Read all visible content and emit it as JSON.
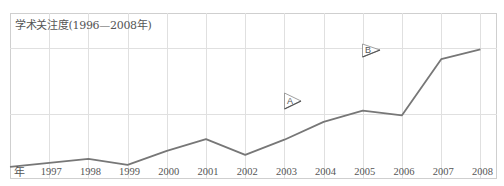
{
  "chart_data": {
    "type": "line",
    "title": "学术关注度(1996—2008年)",
    "xlabel": "年",
    "ylabel": "",
    "categories": [
      "1996",
      "1997",
      "1998",
      "1999",
      "2000",
      "2001",
      "2002",
      "2003",
      "2004",
      "2005",
      "2006",
      "2007",
      "2008"
    ],
    "x_tick_labels": [
      "1997",
      "1998",
      "1999",
      "2000",
      "2001",
      "2002",
      "2003",
      "2004",
      "2005",
      "2006",
      "2007",
      "2008"
    ],
    "series": [
      {
        "name": "学术关注度",
        "values": [
          0.17,
          0.23,
          0.29,
          0.2,
          0.41,
          0.59,
          0.35,
          0.58,
          0.85,
          1.02,
          0.95,
          1.8,
          1.95
        ]
      }
    ],
    "ylim": [
      0,
      2.5
    ],
    "y_tick_labels": [],
    "grid": true,
    "legend": "none",
    "annotations": [
      {
        "label": "A",
        "near": "2003"
      },
      {
        "label": "B",
        "near": "2005"
      }
    ],
    "line_color": "#777777",
    "grid_color": "#dddddd"
  },
  "labels": {
    "title": "学术关注度(1996—2008年)",
    "x_unit": "年",
    "marker_a": "A",
    "marker_b": "B",
    "x_ticks": [
      "1997",
      "1998",
      "1999",
      "2000",
      "2001",
      "2002",
      "2003",
      "2004",
      "2005",
      "2006",
      "2007",
      "2008"
    ]
  }
}
